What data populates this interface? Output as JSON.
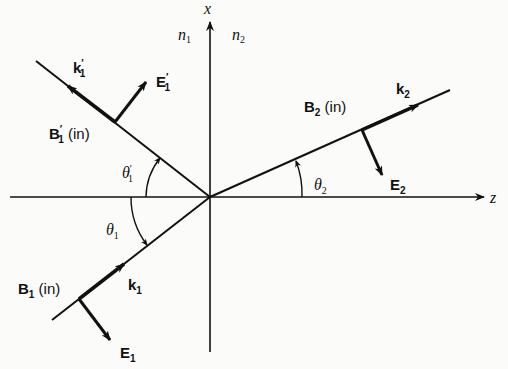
{
  "figure": {
    "axes": {
      "x_label": "x",
      "z_label": "z"
    },
    "media": {
      "n1": {
        "base": "n",
        "sub": "1"
      },
      "n2": {
        "base": "n",
        "sub": "2"
      }
    },
    "incident": {
      "k": {
        "base": "k",
        "sub": "1"
      },
      "E": {
        "base": "E",
        "sub": "1"
      },
      "B": {
        "base": "B",
        "sub": "1",
        "suffix": " (in)"
      },
      "angle": {
        "base": "θ",
        "sub": "1"
      }
    },
    "reflected": {
      "k": {
        "base": "k",
        "prime": "′",
        "sub": "1"
      },
      "E": {
        "base": "E",
        "prime": "′",
        "sub": "1"
      },
      "B": {
        "base": "B",
        "prime": "′",
        "sub": "1",
        "suffix": " (in)"
      },
      "angle": {
        "base": "θ",
        "prime": "′",
        "sub": "1"
      }
    },
    "transmitted": {
      "k": {
        "base": "k",
        "sub": "2"
      },
      "E": {
        "base": "E",
        "sub": "2"
      },
      "B": {
        "base": "B",
        "sub": "2",
        "suffix": " (in)"
      },
      "angle": {
        "base": "θ",
        "sub": "2"
      }
    }
  }
}
